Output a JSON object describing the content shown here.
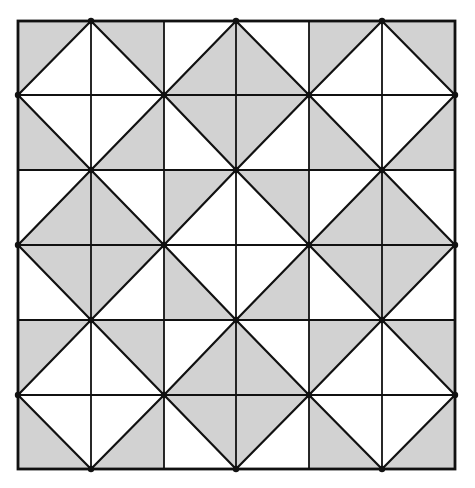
{
  "diagram": {
    "title": "Square tiling pattern of shaded and unshaded right triangles",
    "rows": 6,
    "cols": 6,
    "grid_x": [
      18,
      91,
      164,
      236,
      309,
      382,
      455
    ],
    "grid_y": [
      21,
      95,
      170,
      245,
      320,
      395,
      469
    ],
    "colors": {
      "shade": "#d2d2d2",
      "background": "#ffffff",
      "line": "#111111"
    },
    "cells": [
      [
        {
          "diag": "/",
          "shade": "TL"
        },
        {
          "diag": "\\",
          "shade": "TR"
        },
        {
          "diag": "/",
          "shade": "BR"
        },
        {
          "diag": "\\",
          "shade": "BL"
        },
        {
          "diag": "/",
          "shade": "TL"
        },
        {
          "diag": "\\",
          "shade": "TR"
        }
      ],
      [
        {
          "diag": "\\",
          "shade": "BL"
        },
        {
          "diag": "/",
          "shade": "BR"
        },
        {
          "diag": "\\",
          "shade": "TR"
        },
        {
          "diag": "/",
          "shade": "TL"
        },
        {
          "diag": "\\",
          "shade": "BL"
        },
        {
          "diag": "/",
          "shade": "BR"
        }
      ],
      [
        {
          "diag": "/",
          "shade": "BR"
        },
        {
          "diag": "\\",
          "shade": "BL"
        },
        {
          "diag": "/",
          "shade": "TL"
        },
        {
          "diag": "\\",
          "shade": "TR"
        },
        {
          "diag": "/",
          "shade": "BR"
        },
        {
          "diag": "\\",
          "shade": "BL"
        }
      ],
      [
        {
          "diag": "\\",
          "shade": "TR"
        },
        {
          "diag": "/",
          "shade": "TL"
        },
        {
          "diag": "\\",
          "shade": "BL"
        },
        {
          "diag": "/",
          "shade": "BR"
        },
        {
          "diag": "\\",
          "shade": "TR"
        },
        {
          "diag": "/",
          "shade": "TL"
        }
      ],
      [
        {
          "diag": "/",
          "shade": "TL"
        },
        {
          "diag": "\\",
          "shade": "TR"
        },
        {
          "diag": "/",
          "shade": "BR"
        },
        {
          "diag": "\\",
          "shade": "BL"
        },
        {
          "diag": "/",
          "shade": "TL"
        },
        {
          "diag": "\\",
          "shade": "TR"
        }
      ],
      [
        {
          "diag": "\\",
          "shade": "BL"
        },
        {
          "diag": "/",
          "shade": "BR"
        },
        {
          "diag": "\\",
          "shade": "TR"
        },
        {
          "diag": "/",
          "shade": "TL"
        },
        {
          "diag": "\\",
          "shade": "BL"
        },
        {
          "diag": "/",
          "shade": "BR"
        }
      ]
    ],
    "vertex_dots": [
      [
        1,
        0
      ],
      [
        3,
        0
      ],
      [
        5,
        0
      ],
      [
        0,
        1
      ],
      [
        2,
        1
      ],
      [
        4,
        1
      ],
      [
        6,
        1
      ],
      [
        1,
        2
      ],
      [
        3,
        2
      ],
      [
        5,
        2
      ],
      [
        0,
        3
      ],
      [
        2,
        3
      ],
      [
        4,
        3
      ],
      [
        6,
        3
      ],
      [
        1,
        4
      ],
      [
        3,
        4
      ],
      [
        5,
        4
      ],
      [
        0,
        5
      ],
      [
        2,
        5
      ],
      [
        4,
        5
      ],
      [
        6,
        5
      ],
      [
        1,
        6
      ],
      [
        3,
        6
      ],
      [
        5,
        6
      ]
    ]
  }
}
